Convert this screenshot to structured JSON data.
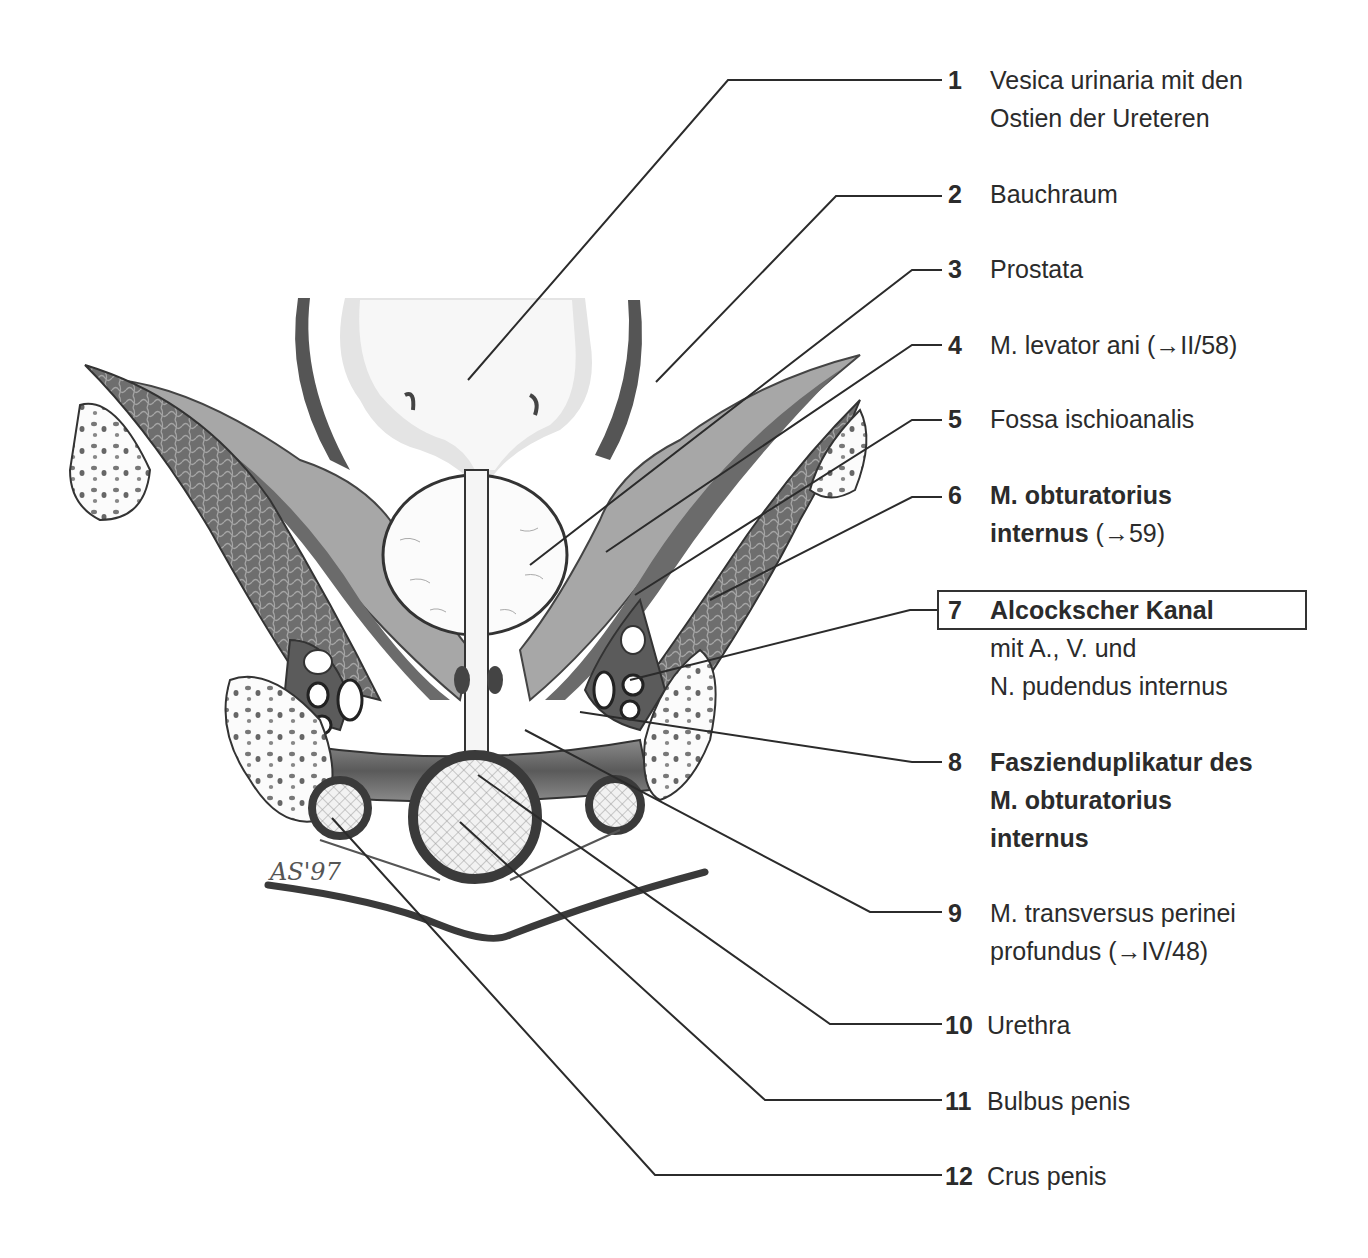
{
  "figure": {
    "signature": "AS'97",
    "stroke_color": "#2b2b2b",
    "tissue_dark": "#6a6a6a",
    "tissue_mid": "#9a9a9a",
    "tissue_light": "#c8c8c8"
  },
  "labels": [
    {
      "num": "1",
      "lines": [
        "Vesica urinaria mit den",
        "Ostien der Ureteren"
      ],
      "bold": false
    },
    {
      "num": "2",
      "lines": [
        "Bauchraum"
      ],
      "bold": false
    },
    {
      "num": "3",
      "lines": [
        "Prostata"
      ],
      "bold": false
    },
    {
      "num": "4",
      "lines": [
        "M. levator ani (→II/58)"
      ],
      "bold": false
    },
    {
      "num": "5",
      "lines": [
        "Fossa ischioanalis"
      ],
      "bold": false
    },
    {
      "num": "6",
      "lines": [
        "M. obturatorius",
        "internus"
      ],
      "suffix": " (→59)",
      "bold": true
    },
    {
      "num": "7",
      "lines": [
        "Alcockscher Kanal",
        "mit A., V. und",
        "N. pudendus internus"
      ],
      "bold_first": true,
      "boxed": true
    },
    {
      "num": "8",
      "lines": [
        "Faszienduplikatur des",
        "M. obturatorius",
        "internus"
      ],
      "bold": true
    },
    {
      "num": "9",
      "lines": [
        "M. transversus perinei",
        "profundus (→IV/48)"
      ],
      "bold": false
    },
    {
      "num": "10",
      "lines": [
        "Urethra"
      ],
      "bold": false
    },
    {
      "num": "11",
      "lines": [
        "Bulbus penis"
      ],
      "bold": false
    },
    {
      "num": "12",
      "lines": [
        "Crus penis"
      ],
      "bold": false
    }
  ]
}
